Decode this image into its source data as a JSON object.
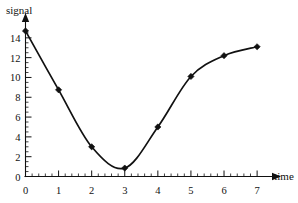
{
  "chart_data": {
    "type": "line",
    "title": "",
    "subtitle": "",
    "xlabel": "time",
    "ylabel": "signal",
    "x": [
      0,
      1,
      2,
      3,
      4,
      5,
      6,
      7
    ],
    "values": [
      14.7,
      8.75,
      3.0,
      0.85,
      5.0,
      10.1,
      12.2,
      13.1
    ],
    "series": [
      {
        "name": "signal",
        "x": [
          0,
          1,
          2,
          3,
          4,
          5,
          6,
          7
        ],
        "values": [
          14.7,
          8.75,
          3.0,
          0.85,
          5.0,
          10.1,
          12.2,
          13.1
        ]
      }
    ],
    "xlim": [
      0,
      7.45
    ],
    "ylim": [
      0,
      15.6
    ],
    "x_ticks": [
      0,
      1,
      2,
      3,
      4,
      5,
      6,
      7
    ],
    "x_tick_labels": [
      "0",
      "1",
      "2",
      "3",
      "4",
      "5",
      "6",
      "7"
    ],
    "y_ticks": [
      0,
      2,
      4,
      6,
      8,
      10,
      12,
      14
    ],
    "y_tick_labels": [
      "0",
      "2",
      "4",
      "6",
      "8",
      "10",
      "12",
      "14"
    ],
    "x_minor_step": 0.2,
    "y_minor_step": 0.5,
    "grid": false,
    "legend": false,
    "legend_position": "none",
    "marker": "square",
    "marker_color": "#111111",
    "line_color": "#111111",
    "background_color": "#ffffff",
    "axis_arrows": true,
    "annotations": []
  },
  "labels": {
    "y_axis_title": "signal",
    "x_axis_title": "time"
  }
}
